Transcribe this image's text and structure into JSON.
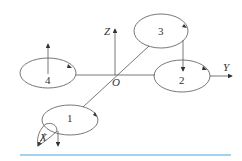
{
  "diagram": {
    "axes": {
      "z_label": "Z",
      "y_label": "Y",
      "x_label": "X",
      "origin_label": "O"
    },
    "rotors": [
      {
        "id": "1",
        "label": "1"
      },
      {
        "id": "2",
        "label": "2"
      },
      {
        "id": "3",
        "label": "3"
      },
      {
        "id": "4",
        "label": "4"
      }
    ],
    "colors": {
      "line": "#555555",
      "rule": "#4aa3df"
    }
  }
}
